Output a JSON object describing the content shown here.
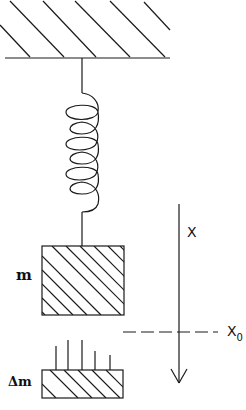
{
  "diagram": {
    "type": "spring-mass system",
    "labels": {
      "mass": "m",
      "added_mass": "Δm",
      "axis": "X",
      "equilibrium": "X",
      "equilibrium_subscript": "0"
    },
    "colors": {
      "stroke": "#1a1a1a",
      "background": "#ffffff"
    }
  }
}
